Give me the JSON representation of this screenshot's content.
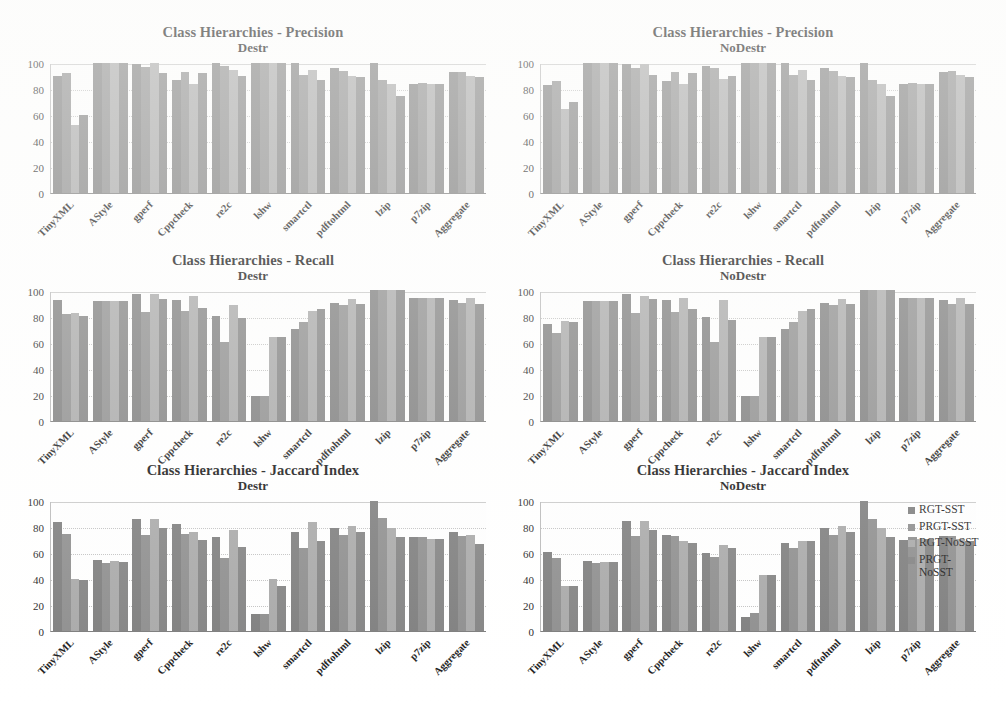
{
  "figure": {
    "categories": [
      "TinyXML",
      "AStyle",
      "gperf",
      "Cppcheck",
      "re2c",
      "lshw",
      "smartctl",
      "pdftohtml",
      "lzip",
      "p7zip",
      "Aggregate"
    ],
    "yticks": [
      100,
      80,
      60,
      40,
      20,
      0
    ],
    "ylim": [
      0,
      100
    ],
    "series_names": [
      "RGT-SST",
      "PRGT-SST",
      "RGT-NoSST",
      "PRGT-NoSST"
    ],
    "series_colors": [
      "#7d7d7d",
      "#8d8d8d",
      "#a8a8a8",
      "#828282"
    ]
  },
  "legend": {
    "items": [
      {
        "label": "RGT-SST",
        "color": "#7d7d7d"
      },
      {
        "label": "PRGT-SST",
        "color": "#8d8d8d"
      },
      {
        "label": "RGT-NoSST",
        "color": "#a8a8a8"
      },
      {
        "label": "PRGT-NoSST",
        "color": "#828282"
      }
    ]
  },
  "chart_data": [
    {
      "id": "precision-destr",
      "type": "bar",
      "title": "Class Hierarchies - Precision",
      "subtitle": "Destr",
      "xlabel": "",
      "ylabel": "",
      "ylim": [
        0,
        100
      ],
      "yticks": [
        0,
        20,
        40,
        60,
        80,
        100
      ],
      "grid": true,
      "legend_position": "none",
      "categories": [
        "TinyXML",
        "AStyle",
        "gperf",
        "Cppcheck",
        "re2c",
        "lshw",
        "smartctl",
        "pdftohtml",
        "lzip",
        "p7zip",
        "Aggregate"
      ],
      "series": [
        {
          "name": "RGT-SST",
          "values": [
            90,
            100,
            99,
            87,
            100,
            100,
            100,
            96,
            100,
            84,
            93
          ]
        },
        {
          "name": "PRGT-SST",
          "values": [
            92,
            100,
            97,
            93,
            98,
            100,
            91,
            94,
            87,
            85,
            93
          ]
        },
        {
          "name": "RGT-NoSST",
          "values": [
            52,
            100,
            100,
            84,
            95,
            100,
            95,
            90,
            84,
            84,
            90
          ]
        },
        {
          "name": "PRGT-NoSST",
          "values": [
            60,
            100,
            92,
            92,
            90,
            100,
            87,
            89,
            75,
            84,
            89
          ]
        }
      ]
    },
    {
      "id": "precision-nodestr",
      "type": "bar",
      "title": "Class Hierarchies - Precision",
      "subtitle": "NoDestr",
      "xlabel": "",
      "ylabel": "",
      "ylim": [
        0,
        100
      ],
      "yticks": [
        0,
        20,
        40,
        60,
        80,
        100
      ],
      "grid": true,
      "legend_position": "none",
      "categories": [
        "TinyXML",
        "AStyle",
        "gperf",
        "Cppcheck",
        "re2c",
        "lshw",
        "smartctl",
        "pdftohtml",
        "lzip",
        "p7zip",
        "Aggregate"
      ],
      "series": [
        {
          "name": "RGT-SST",
          "values": [
            83,
            100,
            99,
            86,
            98,
            100,
            100,
            96,
            100,
            84,
            93
          ]
        },
        {
          "name": "PRGT-SST",
          "values": [
            86,
            100,
            96,
            93,
            96,
            100,
            91,
            94,
            87,
            85,
            94
          ]
        },
        {
          "name": "RGT-NoSST",
          "values": [
            65,
            100,
            99,
            84,
            88,
            100,
            95,
            90,
            84,
            84,
            91
          ]
        },
        {
          "name": "PRGT-NoSST",
          "values": [
            70,
            100,
            91,
            92,
            90,
            100,
            87,
            89,
            75,
            84,
            89
          ]
        }
      ]
    },
    {
      "id": "recall-destr",
      "type": "bar",
      "title": "Class Hierarchies - Recall",
      "subtitle": "Destr",
      "xlabel": "",
      "ylabel": "",
      "ylim": [
        0,
        100
      ],
      "yticks": [
        0,
        20,
        40,
        60,
        80,
        100
      ],
      "grid": true,
      "legend_position": "none",
      "categories": [
        "TinyXML",
        "AStyle",
        "gperf",
        "Cppcheck",
        "re2c",
        "lshw",
        "smartctl",
        "pdftohtml",
        "lzip",
        "p7zip",
        "Aggregate"
      ],
      "series": [
        {
          "name": "RGT-SST",
          "values": [
            93,
            92,
            98,
            93,
            81,
            19,
            71,
            91,
            101,
            95,
            93
          ]
        },
        {
          "name": "PRGT-SST",
          "values": [
            82,
            92,
            84,
            85,
            61,
            19,
            76,
            89,
            101,
            95,
            91
          ]
        },
        {
          "name": "RGT-NoSST",
          "values": [
            83,
            92,
            98,
            96,
            89,
            65,
            85,
            94,
            101,
            95,
            95
          ]
        },
        {
          "name": "PRGT-NoSST",
          "values": [
            81,
            92,
            94,
            87,
            79,
            65,
            86,
            90,
            101,
            95,
            90
          ]
        }
      ]
    },
    {
      "id": "recall-nodestr",
      "type": "bar",
      "title": "Class Hierarchies - Recall",
      "subtitle": "NoDestr",
      "xlabel": "",
      "ylabel": "",
      "ylim": [
        0,
        100
      ],
      "yticks": [
        0,
        20,
        40,
        60,
        80,
        100
      ],
      "grid": true,
      "legend_position": "none",
      "categories": [
        "TinyXML",
        "AStyle",
        "gperf",
        "Cppcheck",
        "re2c",
        "lshw",
        "smartctl",
        "pdftohtml",
        "lzip",
        "p7zip",
        "Aggregate"
      ],
      "series": [
        {
          "name": "RGT-SST",
          "values": [
            75,
            92,
            98,
            93,
            80,
            19,
            71,
            91,
            101,
            95,
            93
          ]
        },
        {
          "name": "PRGT-SST",
          "values": [
            68,
            92,
            83,
            84,
            61,
            19,
            76,
            89,
            101,
            95,
            90
          ]
        },
        {
          "name": "RGT-NoSST",
          "values": [
            77,
            92,
            96,
            95,
            93,
            65,
            85,
            94,
            101,
            95,
            95
          ]
        },
        {
          "name": "PRGT-NoSST",
          "values": [
            76,
            92,
            94,
            86,
            78,
            65,
            86,
            90,
            101,
            95,
            90
          ]
        }
      ]
    },
    {
      "id": "jaccard-destr",
      "type": "bar",
      "title": "Class Hierarchies - Jaccard Index",
      "subtitle": "Destr",
      "xlabel": "",
      "ylabel": "",
      "ylim": [
        0,
        100
      ],
      "yticks": [
        0,
        20,
        40,
        60,
        80,
        100
      ],
      "grid": true,
      "legend_position": "none",
      "categories": [
        "TinyXML",
        "AStyle",
        "gperf",
        "Cppcheck",
        "re2c",
        "lshw",
        "smartctl",
        "pdftohtml",
        "lzip",
        "p7zip",
        "Aggregate"
      ],
      "series": [
        {
          "name": "RGT-SST",
          "values": [
            84,
            55,
            86,
            82,
            72,
            13,
            76,
            79,
            100,
            72,
            76
          ]
        },
        {
          "name": "PRGT-SST",
          "values": [
            75,
            52,
            74,
            75,
            56,
            13,
            64,
            74,
            87,
            72,
            73
          ]
        },
        {
          "name": "RGT-NoSST",
          "values": [
            40,
            54,
            86,
            76,
            78,
            40,
            84,
            81,
            79,
            71,
            74
          ]
        },
        {
          "name": "PRGT-NoSST",
          "values": [
            39,
            53,
            79,
            70,
            65,
            35,
            69,
            76,
            72,
            71,
            67
          ]
        }
      ]
    },
    {
      "id": "jaccard-nodestr",
      "type": "bar",
      "title": "Class Hierarchies - Jaccard Index",
      "subtitle": "NoDestr",
      "xlabel": "",
      "ylabel": "",
      "ylim": [
        0,
        100
      ],
      "yticks": [
        0,
        20,
        40,
        60,
        80,
        100
      ],
      "grid": true,
      "legend_position": "right",
      "categories": [
        "TinyXML",
        "AStyle",
        "gperf",
        "Cppcheck",
        "re2c",
        "lshw",
        "smartctl",
        "pdftohtml",
        "lzip",
        "p7zip",
        "Aggregate"
      ],
      "series": [
        {
          "name": "RGT-SST",
          "values": [
            61,
            54,
            85,
            74,
            60,
            11,
            68,
            79,
            100,
            70,
            73
          ]
        },
        {
          "name": "PRGT-SST",
          "values": [
            56,
            52,
            73,
            73,
            57,
            14,
            64,
            74,
            86,
            72,
            73
          ]
        },
        {
          "name": "RGT-NoSST",
          "values": [
            35,
            53,
            85,
            69,
            66,
            43,
            69,
            81,
            79,
            71,
            71
          ]
        },
        {
          "name": "PRGT-NoSST",
          "values": [
            35,
            53,
            78,
            68,
            64,
            43,
            69,
            76,
            72,
            71,
            69
          ]
        }
      ]
    }
  ]
}
